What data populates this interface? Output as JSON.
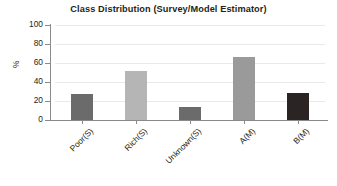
{
  "chart_data": {
    "type": "bar",
    "title": "Class Distribution (Survey/Model Estimator)",
    "xlabel": "",
    "ylabel": "%",
    "categories": [
      "Poor(S)",
      "Rich(S)",
      "Unknown(S)",
      "A(M)",
      "B(M)"
    ],
    "values": [
      27,
      52,
      14,
      66,
      28
    ],
    "bar_colors": [
      "#6b6b6b",
      "#b5b5b5",
      "#6b6b6b",
      "#9a9a9a",
      "#2a2424"
    ],
    "ylim": [
      0,
      100
    ],
    "yticks": [
      0,
      20,
      40,
      60,
      80,
      100
    ],
    "ytick_labels": [
      "0",
      "20",
      "40",
      "60",
      "80",
      "100"
    ],
    "grid": true,
    "grid_axis": "y",
    "grid_color": "#e9e9e9",
    "legend": false,
    "axis_color": "#8a8a8a",
    "background": "#ffffff",
    "text_color": "#231f20"
  }
}
